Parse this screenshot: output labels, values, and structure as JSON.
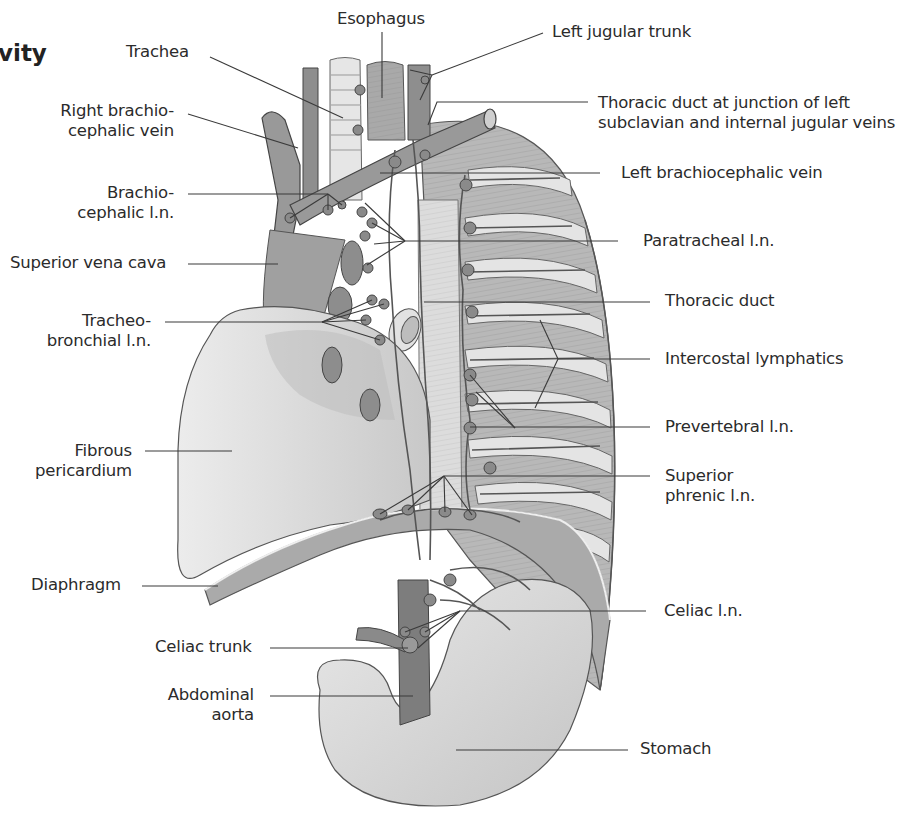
{
  "figure": {
    "heading_fragment": "vity",
    "colors": {
      "background": "#ffffff",
      "text": "#2b2b2b",
      "leader_line": "#3a3a3a",
      "tissue_light": "#d9d9d9",
      "tissue_mid": "#a8a8a8",
      "tissue_dark": "#7c7c7c",
      "lymph_node": "#8a8a8a"
    }
  },
  "labels": {
    "esophagus": "Esophagus",
    "trachea": "Trachea",
    "left_jugular_trunk": "Left jugular trunk",
    "right_brachiocephalic_vein_1": "Right brachio-",
    "right_brachiocephalic_vein_2": "cephalic vein",
    "thoracic_duct_junction_1": "Thoracic duct at junction of left",
    "thoracic_duct_junction_2": "subclavian and internal jugular veins",
    "brachiocephalic_ln_1": "Brachio-",
    "brachiocephalic_ln_2": "cephalic l.n.",
    "left_brachiocephalic_vein": "Left brachiocephalic vein",
    "superior_vena_cava": "Superior vena cava",
    "paratracheal_ln": "Paratracheal l.n.",
    "tracheobronchial_ln_1": "Tracheo-",
    "tracheobronchial_ln_2": "bronchial l.n.",
    "thoracic_duct": "Thoracic duct",
    "intercostal_lymphatics": "Intercostal lymphatics",
    "fibrous_pericardium_1": "Fibrous",
    "fibrous_pericardium_2": "pericardium",
    "prevertebral_ln": "Prevertebral l.n.",
    "superior_phrenic_ln_1": "Superior",
    "superior_phrenic_ln_2": "phrenic l.n.",
    "diaphragm": "Diaphragm",
    "celiac_ln": "Celiac l.n.",
    "celiac_trunk": "Celiac trunk",
    "abdominal_aorta_1": "Abdominal",
    "abdominal_aorta_2": "aorta",
    "stomach": "Stomach"
  }
}
